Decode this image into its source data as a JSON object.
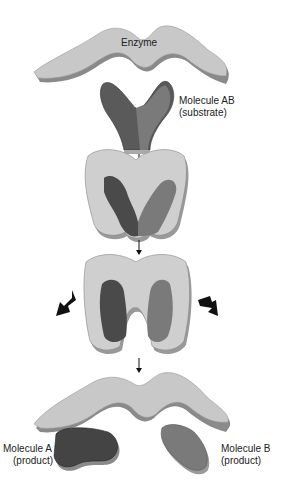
{
  "labels": {
    "enzyme": "Enzyme",
    "substrate_line1": "Molecule AB",
    "substrate_line2": "(substrate)",
    "product_a_line1": "Molecule A",
    "product_a_line2": "(product)",
    "product_b_line1": "Molecule B",
    "product_b_line2": "(product)"
  },
  "colors": {
    "enzyme": "#c8c8c8",
    "enzyme_edge": "#8a8a8a",
    "molecule_a": "#4a4a4a",
    "molecule_b": "#7a7a7a",
    "arrow": "#111111"
  },
  "stages": [
    {
      "name": "enzyme-and-substrate"
    },
    {
      "name": "enzyme-substrate-complex"
    },
    {
      "name": "bond-breaking"
    },
    {
      "name": "enzyme-and-products"
    }
  ]
}
